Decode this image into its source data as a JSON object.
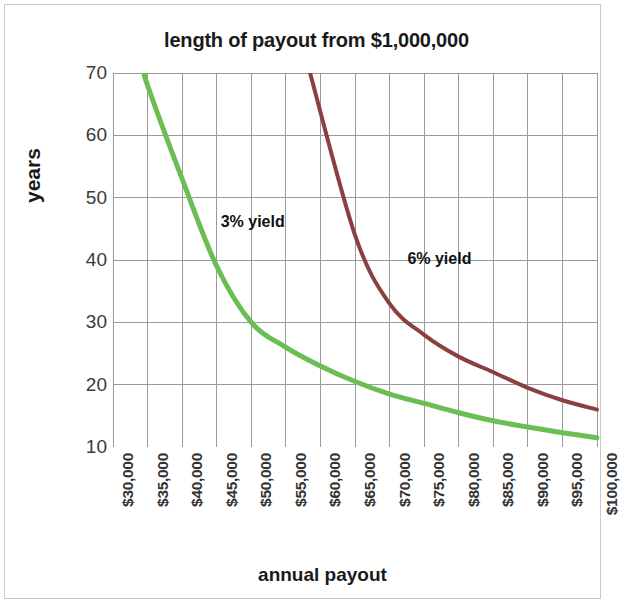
{
  "chart_data": {
    "type": "line",
    "title": "length of payout from $1,000,000",
    "xlabel": "annual payout",
    "ylabel": "years",
    "grid": true,
    "legend_position": "inline-annotation",
    "xlim": [
      30000,
      100000
    ],
    "ylim": [
      10,
      70
    ],
    "y_ticks": [
      10,
      20,
      30,
      40,
      50,
      60,
      70
    ],
    "y_tick_labels": [
      "10",
      "20",
      "30",
      "40",
      "50",
      "60",
      "70"
    ],
    "x_ticks": [
      30000,
      35000,
      40000,
      45000,
      50000,
      55000,
      60000,
      65000,
      70000,
      75000,
      80000,
      85000,
      90000,
      95000,
      100000
    ],
    "x_tick_labels": [
      "$30,000",
      "$35,000",
      "$40,000",
      "$45,000",
      "$50,000",
      "$55,000",
      "$60,000",
      "$65,000",
      "$70,000",
      "$75,000",
      "$80,000",
      "$85,000",
      "$90,000",
      "$95,000",
      "$100,000"
    ],
    "x": [
      30000,
      35000,
      40000,
      45000,
      50000,
      55000,
      60000,
      65000,
      70000,
      75000,
      80000,
      85000,
      90000,
      95000,
      100000
    ],
    "series": [
      {
        "name": "3% yield",
        "color": "#6BBE54",
        "annotation": "3% yield",
        "annotation_x": 45000,
        "annotation_y": 46,
        "values": [
          null,
          68.0,
          53.0,
          39.0,
          30.0,
          26.0,
          23.0,
          20.5,
          18.5,
          17.0,
          15.5,
          14.2,
          13.2,
          12.3,
          11.5
        ]
      },
      {
        "name": "6% yield",
        "color": "#8B4040",
        "annotation": "6% yield",
        "annotation_x": 72000,
        "annotation_y": 40,
        "values": [
          null,
          null,
          null,
          null,
          null,
          null,
          null,
          44.0,
          33.0,
          28.0,
          24.5,
          22.0,
          19.5,
          17.5,
          16.0
        ]
      }
    ],
    "colors": {
      "series_3_percent": "#6BBE54",
      "series_6_percent": "#8B4040",
      "grid": "#9a9a9a",
      "axis": "#7a7a7a",
      "text": "#1a1a1a",
      "frame": "#c9c9c9",
      "background": "#ffffff"
    }
  }
}
